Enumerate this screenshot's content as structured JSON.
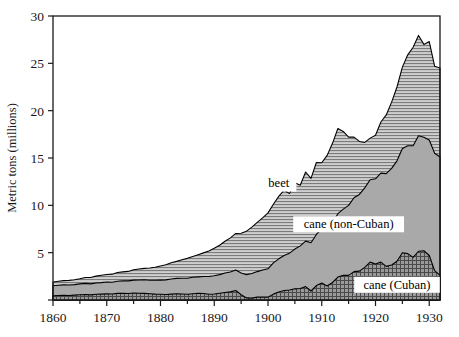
{
  "chart_data": {
    "type": "area",
    "title": "",
    "subtitle": "",
    "xlabel": "",
    "ylabel": "Metric tons (millions)",
    "xlim": [
      1860,
      1932
    ],
    "ylim": [
      0,
      30
    ],
    "xticks": [
      1860,
      1870,
      1880,
      1890,
      1900,
      1910,
      1920,
      1930
    ],
    "xtick_labels": [
      "1860",
      "1870",
      "1880",
      "1890",
      "1900",
      "1910",
      "1920",
      "1930"
    ],
    "yticks": [
      0,
      5,
      10,
      15,
      20,
      25,
      30
    ],
    "ytick_labels": [
      "",
      "5",
      "10",
      "15",
      "20",
      "25",
      "30"
    ],
    "minor_xticks_every": 5,
    "grid": false,
    "stacked": true,
    "legend_position": "inline-annotations",
    "x": [
      1860,
      1861,
      1862,
      1863,
      1864,
      1865,
      1866,
      1867,
      1868,
      1869,
      1870,
      1871,
      1872,
      1873,
      1874,
      1875,
      1876,
      1877,
      1878,
      1879,
      1880,
      1881,
      1882,
      1883,
      1884,
      1885,
      1886,
      1887,
      1888,
      1889,
      1890,
      1891,
      1892,
      1893,
      1894,
      1895,
      1896,
      1897,
      1898,
      1899,
      1900,
      1901,
      1902,
      1903,
      1904,
      1905,
      1906,
      1907,
      1908,
      1909,
      1910,
      1911,
      1912,
      1913,
      1914,
      1915,
      1916,
      1917,
      1918,
      1919,
      1920,
      1921,
      1922,
      1923,
      1924,
      1925,
      1926,
      1927,
      1928,
      1929,
      1930,
      1931,
      1932
    ],
    "series": [
      {
        "name": "cane (Cuban)",
        "order": 1,
        "fill": "#8f8f8f",
        "pattern": "crosshatch-grid",
        "values": [
          0.45,
          0.48,
          0.5,
          0.47,
          0.52,
          0.55,
          0.58,
          0.54,
          0.6,
          0.62,
          0.65,
          0.63,
          0.7,
          0.72,
          0.68,
          0.74,
          0.72,
          0.7,
          0.66,
          0.62,
          0.6,
          0.58,
          0.62,
          0.66,
          0.64,
          0.6,
          0.66,
          0.72,
          0.68,
          0.6,
          0.64,
          0.72,
          0.8,
          0.86,
          1.0,
          0.55,
          0.22,
          0.2,
          0.3,
          0.32,
          0.3,
          0.62,
          0.85,
          1.0,
          1.05,
          1.18,
          1.22,
          1.42,
          0.95,
          1.52,
          1.8,
          1.48,
          1.85,
          2.42,
          2.6,
          2.6,
          3.0,
          3.05,
          3.45,
          4.0,
          3.8,
          4.0,
          3.55,
          3.7,
          4.1,
          5.0,
          4.9,
          4.5,
          5.15,
          5.2,
          4.7,
          3.1,
          2.6
        ]
      },
      {
        "name": "cane (non-Cuban)",
        "order": 2,
        "fill": "#a9a9a9",
        "pattern": "solid",
        "values": [
          1.05,
          1.08,
          1.1,
          1.12,
          1.1,
          1.15,
          1.18,
          1.16,
          1.2,
          1.22,
          1.25,
          1.24,
          1.28,
          1.3,
          1.34,
          1.36,
          1.4,
          1.44,
          1.42,
          1.46,
          1.5,
          1.55,
          1.6,
          1.62,
          1.66,
          1.7,
          1.74,
          1.72,
          1.8,
          1.88,
          1.92,
          1.96,
          2.05,
          2.1,
          2.18,
          2.3,
          2.45,
          2.6,
          2.7,
          2.85,
          3.0,
          3.3,
          3.5,
          3.7,
          3.9,
          4.2,
          4.5,
          4.8,
          5.1,
          5.4,
          5.7,
          6.0,
          6.3,
          6.7,
          7.0,
          7.4,
          7.8,
          8.1,
          8.4,
          8.7,
          9.0,
          9.4,
          9.8,
          10.2,
          10.6,
          11.0,
          11.4,
          11.8,
          12.2,
          12.0,
          12.2,
          12.4,
          12.5
        ]
      },
      {
        "name": "beet",
        "order": 3,
        "fill": "#c8c8c8",
        "pattern": "horizontal-lines",
        "values": [
          0.4,
          0.42,
          0.45,
          0.48,
          0.52,
          0.55,
          0.62,
          0.68,
          0.72,
          0.78,
          0.8,
          0.86,
          0.92,
          0.95,
          1.0,
          1.1,
          1.15,
          1.2,
          1.3,
          1.38,
          1.5,
          1.6,
          1.72,
          1.8,
          1.95,
          2.1,
          2.2,
          2.35,
          2.5,
          2.7,
          2.9,
          3.1,
          3.35,
          3.6,
          3.85,
          4.2,
          4.6,
          4.9,
          5.2,
          5.5,
          5.9,
          6.2,
          6.6,
          6.9,
          6.3,
          7.0,
          6.4,
          7.3,
          6.8,
          7.6,
          7.0,
          7.8,
          8.4,
          9.0,
          8.2,
          7.2,
          6.4,
          5.6,
          4.8,
          4.4,
          4.6,
          5.4,
          6.2,
          7.0,
          7.8,
          8.6,
          9.6,
          10.4,
          10.6,
          9.8,
          10.4,
          9.2,
          9.4
        ]
      }
    ],
    "annotations": [
      {
        "text": "beet",
        "x": 1902,
        "y": 12.3
      },
      {
        "text": "cane (non-Cuban)",
        "x": 1915,
        "y": 8.0
      },
      {
        "text": "cane (Cuban)",
        "x": 1924,
        "y": 1.6
      }
    ]
  },
  "style": {
    "axis_color": "#1a1a1a",
    "beet_fill": "#c8c8c8",
    "cane_noncuban_fill": "#a9a9a9",
    "cane_cuban_fill": "#8f8f8f",
    "background": "#ffffff"
  }
}
